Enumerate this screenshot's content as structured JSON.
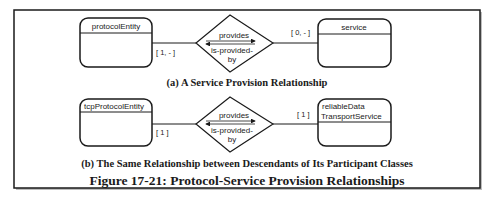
{
  "figure": {
    "title": "Figure 17-21: Protocol-Service Provision Relationships"
  },
  "panel_a": {
    "caption": "(a) A Service Provision Relationship",
    "left_class": {
      "name": "protocolEntity"
    },
    "right_class": {
      "name": "service"
    },
    "relationship": {
      "forward_label": "provides",
      "reverse_label_line1": "is-provided-",
      "reverse_label_line2": "by"
    },
    "left_multiplicity": "[ 1, - ]",
    "right_multiplicity": "[ 0, - ]"
  },
  "panel_b": {
    "caption": "(b) The Same Relationship between Descendants of Its Participant Classes",
    "left_class": {
      "name": "tcpProtocolEntity"
    },
    "right_class": {
      "name_line1": "reliableData",
      "name_line2": "TransportService"
    },
    "relationship": {
      "forward_label": "provides",
      "reverse_label_line1": "is-provided-",
      "reverse_label_line2": "by"
    },
    "left_multiplicity": "[ 1 ]",
    "right_multiplicity": "[ 1 ]"
  },
  "colors": {
    "stroke": "#1a1a1a",
    "text": "#222222",
    "background": "#ffffff"
  }
}
